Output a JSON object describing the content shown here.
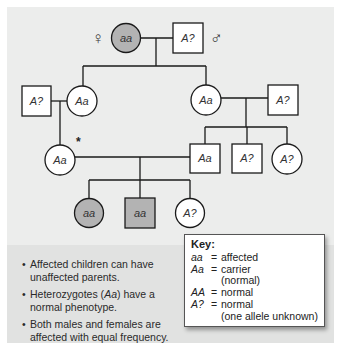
{
  "colors": {
    "panel_bg": "#ecedec",
    "panel_lower_bg": "#e1e2e1",
    "affected_fill": "#b3b3b3",
    "unaffected_fill": "#ffffff",
    "line": "#1a1a1a"
  },
  "symbols": {
    "female": "♀",
    "male": "♂",
    "asterisk": "*"
  },
  "pedigree": {
    "gen1": {
      "female": {
        "label": "aa",
        "affected": true
      },
      "male": {
        "label": "A?",
        "affected": false
      }
    },
    "gen2": {
      "left_spouse_male": {
        "label": "A?",
        "affected": false
      },
      "left_daughter": {
        "label": "Aa",
        "affected": false
      },
      "right_daughter": {
        "label": "Aa",
        "affected": false
      },
      "right_spouse_male": {
        "label": "A?",
        "affected": false
      }
    },
    "gen3": {
      "left_female": {
        "label": "Aa",
        "affected": false,
        "marked": true
      },
      "son_carrier": {
        "label": "Aa",
        "affected": false
      },
      "son_unknown": {
        "label": "A?",
        "affected": false
      },
      "daughter_unknown": {
        "label": "A?",
        "affected": false
      }
    },
    "gen4": {
      "daughter_affected": {
        "label": "aa",
        "affected": true
      },
      "son_affected": {
        "label": "aa",
        "affected": true
      },
      "daughter_unknown": {
        "label": "A?",
        "affected": false
      }
    }
  },
  "notes": {
    "bullets": [
      {
        "text_a": "Affected children can have unaffected parents.",
        "italic": "",
        "text_b": ""
      },
      {
        "text_a": "Heterozygotes (",
        "italic": "Aa",
        "text_b": ") have a normal phenotype."
      },
      {
        "text_a": "Both males and females are affected with equal frequency.",
        "italic": "",
        "text_b": ""
      }
    ]
  },
  "key": {
    "title": "Key:",
    "entries": [
      {
        "symbol": "aa",
        "eq": "=",
        "meaning": "affected",
        "sub": ""
      },
      {
        "symbol": "Aa",
        "eq": "=",
        "meaning": "carrier",
        "sub": "(normal)"
      },
      {
        "symbol": "AA",
        "eq": "=",
        "meaning": "normal",
        "sub": ""
      },
      {
        "symbol": "A?",
        "eq": "=",
        "meaning": "normal",
        "sub": "(one allele unknown)"
      }
    ]
  }
}
